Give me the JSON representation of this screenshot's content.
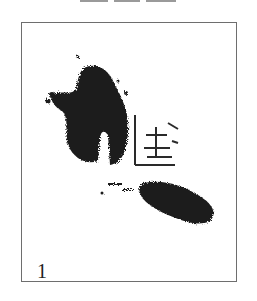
{
  "panel": {
    "label": "1",
    "description": "Rubbing/scan of an ink brush-stroke character fragment",
    "border_color": "#6e6e6e",
    "ink_color": "#1e1e1e"
  },
  "top_fragments": [
    {
      "x": 0,
      "w": 28
    },
    {
      "x": 34,
      "w": 26
    },
    {
      "x": 66,
      "w": 30
    }
  ]
}
